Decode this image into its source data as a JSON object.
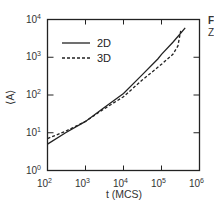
{
  "chart_data": {
    "type": "line",
    "title": "",
    "xlabel": "t (MCS)",
    "ylabel": "⟨A⟩",
    "xscale": "log",
    "yscale": "log",
    "xlim": [
      100,
      1000000
    ],
    "ylim": [
      1,
      10000
    ],
    "grid": false,
    "legend_position": "upper left",
    "x_ticks": [
      {
        "base": "10",
        "exp": "2"
      },
      {
        "base": "10",
        "exp": "3"
      },
      {
        "base": "10",
        "exp": "4"
      },
      {
        "base": "10",
        "exp": "5"
      },
      {
        "base": "10",
        "exp": "6"
      }
    ],
    "y_ticks": [
      {
        "base": "10",
        "exp": "0"
      },
      {
        "base": "10",
        "exp": "1"
      },
      {
        "base": "10",
        "exp": "2"
      },
      {
        "base": "10",
        "exp": "3"
      },
      {
        "base": "10",
        "exp": "4"
      }
    ],
    "series": [
      {
        "name": "2D",
        "style": "solid",
        "x": [
          100,
          300,
          1000,
          3000,
          10000,
          30000,
          80000,
          100000,
          200000,
          300000,
          420000
        ],
        "y": [
          5,
          10,
          20,
          45,
          110,
          330,
          900,
          1200,
          2500,
          4000,
          6000
        ]
      },
      {
        "name": "3D",
        "style": "dashed",
        "x": [
          100,
          300,
          1000,
          3000,
          10000,
          30000,
          100000,
          200000,
          270000,
          320000
        ],
        "y": [
          7,
          11,
          20,
          42,
          90,
          240,
          650,
          1200,
          2000,
          5000
        ]
      }
    ]
  },
  "legend": {
    "entries": [
      {
        "label": "2D"
      },
      {
        "label": "3D"
      }
    ]
  },
  "side_text": {
    "line1": "F",
    "line2": "Z"
  }
}
